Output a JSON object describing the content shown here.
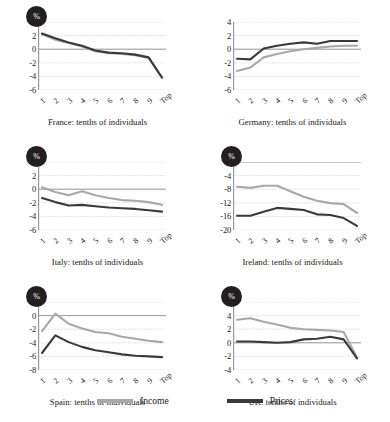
{
  "legend": {
    "income_label": "Income",
    "prices_label": "Prices",
    "income_color": "#a8a8a8",
    "prices_color": "#3a3a3a"
  },
  "axis_badge": "%",
  "chart_data": [
    {
      "type": "line",
      "title": "France: tenths of individuals",
      "xlabel": "tenths of individuals",
      "ylabel": "%",
      "categories": [
        "1",
        "2",
        "3",
        "4",
        "5",
        "6",
        "7",
        "8",
        "9",
        "Top"
      ],
      "yticks": [
        4,
        2,
        0,
        -2,
        -4,
        -6
      ],
      "ylim": [
        -6,
        4
      ],
      "grid": true,
      "legend_position": "figure-bottom",
      "series": [
        {
          "name": "Income",
          "values": [
            2.2,
            1.4,
            0.9,
            0.4,
            -0.3,
            -0.6,
            -0.7,
            -0.9,
            -1.3,
            -4.1
          ]
        },
        {
          "name": "Prices",
          "values": [
            2.3,
            1.6,
            1.0,
            0.5,
            -0.2,
            -0.5,
            -0.6,
            -0.8,
            -1.2,
            -4.2
          ]
        }
      ]
    },
    {
      "type": "line",
      "title": "Germany: tenths of individuals",
      "xlabel": "tenths of individuals",
      "ylabel": "%",
      "categories": [
        "1",
        "2",
        "3",
        "4",
        "5",
        "6",
        "7",
        "8",
        "9",
        "Top"
      ],
      "yticks": [
        4,
        2,
        0,
        -2,
        -4,
        -6
      ],
      "ylim": [
        -6,
        4
      ],
      "grid": true,
      "legend_position": "figure-bottom",
      "series": [
        {
          "name": "Income",
          "values": [
            -3.2,
            -2.7,
            -1.2,
            -0.7,
            -0.3,
            0.0,
            0.2,
            0.4,
            0.5,
            0.5
          ]
        },
        {
          "name": "Prices",
          "values": [
            -1.4,
            -1.5,
            0.1,
            0.5,
            0.8,
            1.0,
            0.8,
            1.2,
            1.2,
            1.2
          ]
        }
      ]
    },
    {
      "type": "line",
      "title": "Italy: tenths of individuals",
      "xlabel": "tenths of individuals",
      "ylabel": "%",
      "categories": [
        "1",
        "2",
        "3",
        "4",
        "5",
        "6",
        "7",
        "8",
        "9",
        "Top"
      ],
      "yticks": [
        4,
        2,
        0,
        -2,
        -4,
        -6
      ],
      "ylim": [
        -6,
        4
      ],
      "grid": true,
      "legend_position": "figure-bottom",
      "series": [
        {
          "name": "Income",
          "values": [
            0.3,
            -0.4,
            -0.9,
            -0.3,
            -0.9,
            -1.3,
            -1.6,
            -1.7,
            -1.9,
            -2.3
          ]
        },
        {
          "name": "Prices",
          "values": [
            -1.3,
            -1.9,
            -2.4,
            -2.3,
            -2.5,
            -2.7,
            -2.8,
            -2.9,
            -3.1,
            -3.3
          ]
        }
      ]
    },
    {
      "type": "line",
      "title": "Ireland: tenths of individuals",
      "xlabel": "tenths of individuals",
      "ylabel": "%",
      "categories": [
        "1",
        "2",
        "3",
        "4",
        "5",
        "6",
        "7",
        "8",
        "9",
        "Top"
      ],
      "yticks": [
        0,
        -4,
        -8,
        -12,
        -16,
        -20
      ],
      "ylim": [
        -20,
        0
      ],
      "grid": true,
      "legend_position": "figure-bottom",
      "series": [
        {
          "name": "Income",
          "values": [
            -7.3,
            -7.6,
            -7.0,
            -7.0,
            -8.6,
            -10.2,
            -11.4,
            -12.1,
            -12.4,
            -15.0
          ]
        },
        {
          "name": "Prices",
          "values": [
            -15.8,
            -15.8,
            -14.6,
            -13.5,
            -13.8,
            -14.1,
            -15.4,
            -15.6,
            -16.5,
            -18.8
          ]
        }
      ]
    },
    {
      "type": "line",
      "title": "Spain: tenths of individuals",
      "xlabel": "tenths of individuals",
      "ylabel": "%",
      "categories": [
        "1",
        "2",
        "3",
        "4",
        "5",
        "6",
        "7",
        "8",
        "9",
        "Top"
      ],
      "yticks": [
        2,
        0,
        -2,
        -4,
        -6,
        -8
      ],
      "ylim": [
        -8,
        2
      ],
      "grid": true,
      "legend_position": "figure-bottom",
      "series": [
        {
          "name": "Income",
          "values": [
            -2.3,
            0.3,
            -1.2,
            -1.9,
            -2.4,
            -2.6,
            -3.1,
            -3.4,
            -3.7,
            -3.9
          ]
        },
        {
          "name": "Prices",
          "values": [
            -5.5,
            -2.9,
            -3.9,
            -4.6,
            -5.1,
            -5.4,
            -5.7,
            -5.9,
            -6.0,
            -6.1
          ]
        }
      ]
    },
    {
      "type": "line",
      "title": "UK: tenths of individuals",
      "xlabel": "tenths of individuals",
      "ylabel": "%",
      "categories": [
        "1",
        "2",
        "3",
        "4",
        "5",
        "6",
        "7",
        "8",
        "9",
        "Top"
      ],
      "yticks": [
        6,
        4,
        2,
        0,
        -2,
        -4
      ],
      "ylim": [
        -4,
        6
      ],
      "grid": true,
      "legend_position": "figure-bottom",
      "series": [
        {
          "name": "Income",
          "values": [
            3.4,
            3.6,
            3.1,
            2.7,
            2.2,
            2.0,
            1.9,
            1.8,
            1.6,
            -2.2
          ]
        },
        {
          "name": "Prices",
          "values": [
            0.2,
            0.2,
            0.1,
            0.0,
            0.1,
            0.5,
            0.6,
            0.9,
            0.5,
            -2.3
          ]
        }
      ]
    }
  ]
}
